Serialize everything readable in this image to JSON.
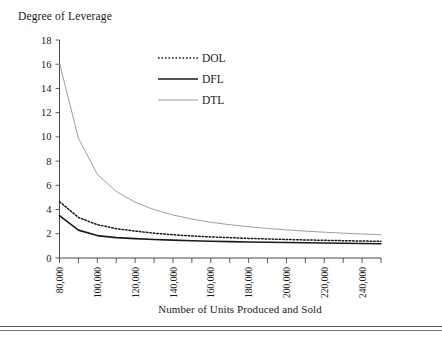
{
  "chart_data": {
    "type": "line",
    "title": "Degree of Leverage",
    "xlabel": "Number of Units Produced and Sold",
    "ylabel": "Degree of Leverage",
    "grid": false,
    "legend_position": "upper-center",
    "xlim": [
      80000,
      250000
    ],
    "ylim": [
      0,
      18
    ],
    "ytick_labels": [
      "0",
      "2",
      "4",
      "6",
      "8",
      "10",
      "12",
      "14",
      "16",
      "18"
    ],
    "ytick_values": [
      0,
      2,
      4,
      6,
      8,
      10,
      12,
      14,
      16,
      18
    ],
    "xtick_labels": [
      "80,000",
      "100,000",
      "120,000",
      "140,000",
      "160,000",
      "180,000",
      "200,000",
      "220,000",
      "240,000"
    ],
    "xtick_values": [
      80000,
      100000,
      120000,
      140000,
      160000,
      180000,
      200000,
      220000,
      240000
    ],
    "x": [
      80000,
      90000,
      100000,
      110000,
      120000,
      130000,
      140000,
      150000,
      160000,
      170000,
      180000,
      190000,
      200000,
      210000,
      220000,
      230000,
      240000,
      250000
    ],
    "series": [
      {
        "name": "DOL",
        "style": "dotted",
        "color": "#1a1a1a",
        "values": [
          4.65,
          3.35,
          2.75,
          2.42,
          2.22,
          2.05,
          1.92,
          1.82,
          1.74,
          1.68,
          1.62,
          1.57,
          1.53,
          1.49,
          1.46,
          1.43,
          1.4,
          1.38
        ]
      },
      {
        "name": "DFL",
        "style": "solid-thick",
        "color": "#1a1a1a",
        "values": [
          3.5,
          2.3,
          1.85,
          1.68,
          1.6,
          1.53,
          1.48,
          1.42,
          1.38,
          1.35,
          1.32,
          1.3,
          1.28,
          1.26,
          1.24,
          1.22,
          1.2,
          1.18
        ]
      },
      {
        "name": "DTL",
        "style": "solid-thin",
        "color": "#8c8c8c",
        "values": [
          16.1,
          9.9,
          6.9,
          5.5,
          4.6,
          4.0,
          3.55,
          3.22,
          2.95,
          2.75,
          2.58,
          2.44,
          2.32,
          2.22,
          2.13,
          2.05,
          1.98,
          1.92
        ]
      }
    ],
    "legend": [
      {
        "label": "DOL",
        "style": "dotted",
        "color": "#1a1a1a"
      },
      {
        "label": "DFL",
        "style": "solid-thick",
        "color": "#1a1a1a"
      },
      {
        "label": "DTL",
        "style": "solid-thin",
        "color": "#8c8c8c"
      }
    ]
  }
}
